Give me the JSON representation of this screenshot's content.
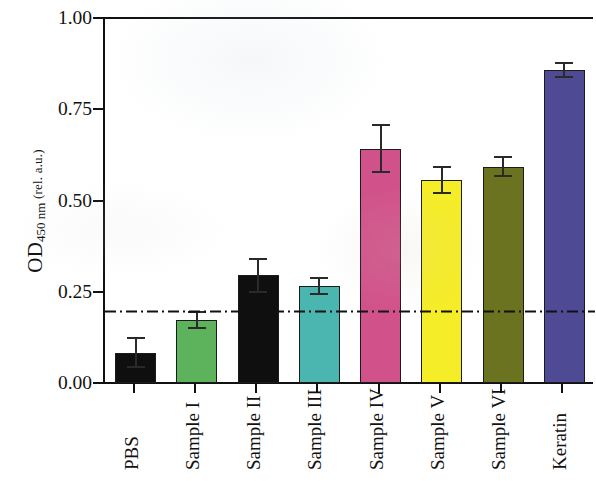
{
  "chart_data": {
    "type": "bar",
    "title": "",
    "xlabel": "",
    "ylabel": "OD450 nm (rel. a.u.)",
    "ylabel_parts": {
      "main": "OD",
      "subscript": "450 nm",
      "unit": " (rel. a.u.)"
    },
    "ylim": [
      0.0,
      1.0
    ],
    "ytick_labels": [
      "1.00",
      "0.75",
      "0.50",
      "0.25",
      "0.00"
    ],
    "ytick_values": [
      1.0,
      0.75,
      0.5,
      0.25,
      0.0
    ],
    "grid": false,
    "legend": "none",
    "categories": [
      "PBS",
      "Sample I",
      "Sample II",
      "Sample III",
      "Sample IV",
      "Sample V",
      "Sample VI",
      "Keratin"
    ],
    "values": [
      0.083,
      0.172,
      0.295,
      0.267,
      0.642,
      0.556,
      0.593,
      0.857
    ],
    "errors": [
      0.04,
      0.022,
      0.045,
      0.022,
      0.065,
      0.035,
      0.025,
      0.02
    ],
    "colors": [
      "#0f0f0f",
      "#5cb35c",
      "#0f0f0f",
      "#4bb5b0",
      "#d1528a",
      "#f5ed28",
      "#6b7320",
      "#4f4a94"
    ],
    "bar_edge_color": "#1b1b1b",
    "annotations": [
      {
        "name": "cutoff-threshold",
        "type": "hline",
        "value": 0.195,
        "style": "dash-dot",
        "color": "#111111",
        "label": ""
      }
    ],
    "bars": [
      {
        "category": "PBS",
        "value": 0.083,
        "error": 0.04,
        "color": "#0f0f0f"
      },
      {
        "category": "Sample I",
        "value": 0.172,
        "error": 0.022,
        "color": "#5cb35c"
      },
      {
        "category": "Sample II",
        "value": 0.295,
        "error": 0.045,
        "color": "#0f0f0f"
      },
      {
        "category": "Sample III",
        "value": 0.267,
        "error": 0.022,
        "color": "#4bb5b0"
      },
      {
        "category": "Sample IV",
        "value": 0.642,
        "error": 0.065,
        "color": "#d1528a"
      },
      {
        "category": "Sample V",
        "value": 0.556,
        "error": 0.035,
        "color": "#f5ed28"
      },
      {
        "category": "Sample VI",
        "value": 0.593,
        "error": 0.025,
        "color": "#6b7320"
      },
      {
        "category": "Keratin",
        "value": 0.857,
        "error": 0.02,
        "color": "#4f4a94"
      }
    ]
  }
}
